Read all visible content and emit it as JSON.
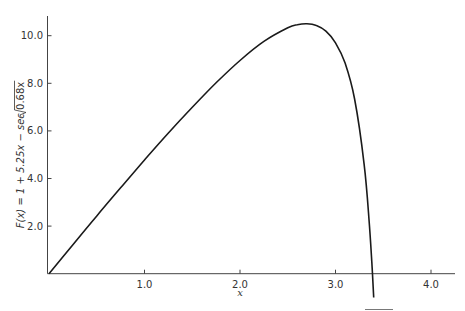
{
  "chart_data": {
    "type": "line",
    "title": "",
    "xlabel": "x",
    "ylabel": "F(x) = 1 + 5.25x − sec √(0.68x)",
    "xlim": [
      0,
      4.2
    ],
    "ylim": [
      0,
      10.8
    ],
    "grid": false,
    "legend": null,
    "x_ticks": [
      1.0,
      2.0,
      3.0,
      4.0
    ],
    "x_tick_labels": [
      "1.0",
      "2.0",
      "3.0",
      "4.0"
    ],
    "y_ticks": [
      2.0,
      4.0,
      6.0,
      8.0,
      10.0
    ],
    "y_tick_labels": [
      "2.0",
      "4.0",
      "6.0",
      "8.0",
      "10.0"
    ],
    "series": [
      {
        "name": "F(x)",
        "color": "#1a1a1a",
        "x": [
          0,
          0.25,
          0.5,
          0.75,
          1.0,
          1.25,
          1.5,
          1.75,
          2.0,
          2.25,
          2.5,
          2.6,
          2.7,
          2.8,
          2.9,
          3.0,
          3.1,
          3.2,
          3.3,
          3.35,
          3.38,
          3.4
        ],
        "y": [
          0,
          1.22,
          2.43,
          3.61,
          4.78,
          5.91,
          6.99,
          8.02,
          8.96,
          9.76,
          10.33,
          10.46,
          10.5,
          10.43,
          10.19,
          9.7,
          8.85,
          7.34,
          4.6,
          2.33,
          0.5,
          -1.0
        ]
      }
    ]
  },
  "labels": {
    "xlabel": "x",
    "ylabel_prefix": "F(x) = 1 + 5.25x − sec ",
    "ylabel_radicand": "0.68x"
  }
}
